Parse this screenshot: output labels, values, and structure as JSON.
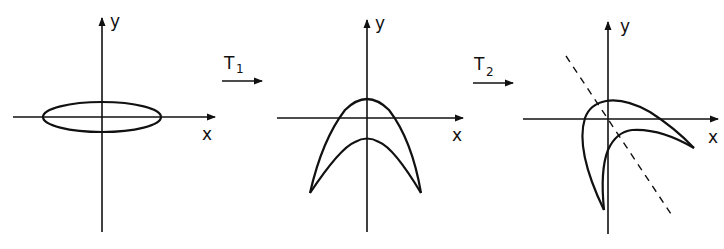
{
  "figure": {
    "panels": [
      {
        "id": "original",
        "shape": "ellipse",
        "axis_labels": {
          "x": "x",
          "y": "y"
        }
      },
      {
        "id": "after-T1",
        "shape": "crescent (two nested downward parabolas meeting at cusps)",
        "axis_labels": {
          "x": "x",
          "y": "y"
        }
      },
      {
        "id": "after-T2",
        "shape": "skewed crescent with dashed symmetry line",
        "axis_labels": {
          "x": "x",
          "y": "y"
        }
      }
    ],
    "transforms": [
      {
        "name": "T",
        "subscript": "1"
      },
      {
        "name": "T",
        "subscript": "2"
      }
    ]
  }
}
